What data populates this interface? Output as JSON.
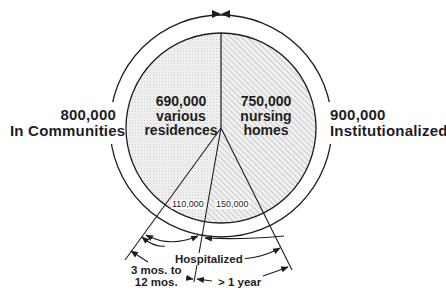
{
  "diagram": {
    "type": "pie-with-annotated-arcs",
    "left_group": {
      "value": "800,000",
      "label": "In Communities"
    },
    "right_group": {
      "value": "900,000",
      "label": "Institutionalized"
    },
    "slices": [
      {
        "value": "690,000",
        "label_line1": "various",
        "label_line2": "residences",
        "pattern": "stipple"
      },
      {
        "value": "750,000",
        "label_line1": "nursing",
        "label_line2": "homes",
        "pattern": "hatch"
      },
      {
        "value": "110,000",
        "pattern": "stipple"
      },
      {
        "value": "150,000",
        "pattern": "hatch"
      }
    ],
    "annotations": {
      "hospitalized": "Hospitalized",
      "short_stay_line1": "3 mos. to",
      "short_stay_line2": "12 mos.",
      "long_stay": "> 1 year"
    },
    "colors": {
      "ink": "#1e1e1e",
      "stipple": "#e4e4e4",
      "hatch": "#bdbdbd",
      "background": "#ffffff"
    }
  }
}
